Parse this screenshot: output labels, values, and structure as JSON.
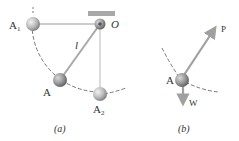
{
  "figure_a": {
    "caption": "(a)",
    "labels": {
      "A1": "A",
      "A1_sub": "1",
      "O": "O",
      "l": "l",
      "A": "A",
      "A2": "A",
      "A2_sub": "2"
    }
  },
  "figure_b": {
    "caption": "(b)",
    "labels": {
      "A": "A",
      "P": "P",
      "W": "W"
    }
  },
  "colors": {
    "rod": "#b8b8b8",
    "support": "#a8a8a8",
    "ball": "#bdbdbd",
    "arrow": "#a0a0a0",
    "arc": "#555555",
    "text": "#333333"
  }
}
